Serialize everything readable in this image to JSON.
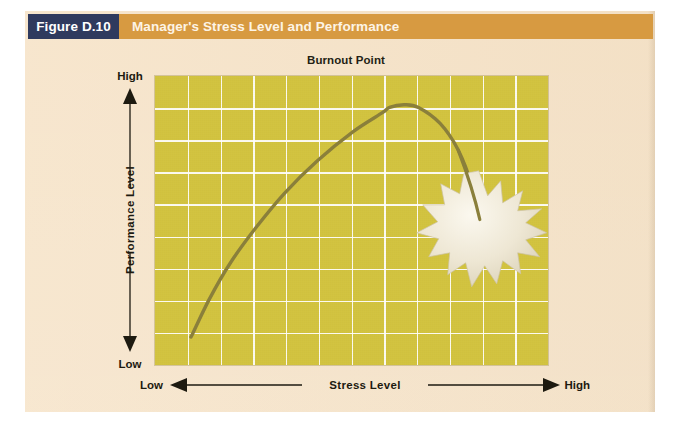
{
  "figure": {
    "tag": "Figure D.10",
    "title": "Manager's Stress Level and Performance"
  },
  "colors": {
    "tag_bg": "#2f3a5e",
    "title_bg": "#d79a41",
    "page_bg": "#f6e3c8",
    "plot_bg": "#d2c33f",
    "grid": "#ffffff",
    "curve": "#8a7f3a",
    "burst": "#ece5d2"
  },
  "chart_data": {
    "type": "line",
    "title": "Manager's Stress Level and Performance",
    "xlabel": "Stress Level",
    "ylabel": "Performance Level",
    "x_axis_low_label": "Low",
    "x_axis_high_label": "High",
    "y_axis_low_label": "Low",
    "y_axis_high_label": "High",
    "annotation": "Burnout Point",
    "grid": true,
    "grid_columns": 12,
    "grid_rows": 9,
    "xlim": [
      0,
      1
    ],
    "ylim": [
      0,
      1
    ],
    "legend": "none",
    "series": [
      {
        "name": "Performance vs Stress",
        "description": "Inverted-U curve: performance rises with stress to an optimal peak, then falls sharply to the burnout point.",
        "points": [
          {
            "x": 0.05,
            "y": 0.06
          },
          {
            "x": 0.1,
            "y": 0.2
          },
          {
            "x": 0.16,
            "y": 0.34
          },
          {
            "x": 0.23,
            "y": 0.47
          },
          {
            "x": 0.31,
            "y": 0.6
          },
          {
            "x": 0.4,
            "y": 0.72
          },
          {
            "x": 0.5,
            "y": 0.83
          },
          {
            "x": 0.58,
            "y": 0.9
          },
          {
            "x": 0.6,
            "y": 0.92
          },
          {
            "x": 0.64,
            "y": 0.93
          },
          {
            "x": 0.68,
            "y": 0.92
          },
          {
            "x": 0.74,
            "y": 0.86
          },
          {
            "x": 0.79,
            "y": 0.76
          },
          {
            "x": 0.83,
            "y": 0.62
          },
          {
            "x": 0.85,
            "y": 0.5
          }
        ]
      }
    ],
    "markers": [
      {
        "name": "burnout-point",
        "label": "Burnout Point",
        "shape": "starburst",
        "x": 0.855,
        "y": 0.465
      }
    ]
  }
}
